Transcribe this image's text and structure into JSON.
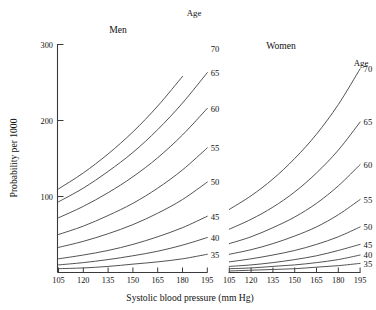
{
  "chart_data": {
    "type": "line",
    "title": "",
    "xlabel": "Systolic blood pressure (mm Hg)",
    "ylabel": "Probability per 1000",
    "x": [
      105,
      120,
      135,
      150,
      165,
      180,
      195
    ],
    "xlim": [
      105,
      195
    ],
    "ylim": [
      0,
      300
    ],
    "xticks": [
      "105",
      "120",
      "135",
      "150",
      "165",
      "180",
      "195"
    ],
    "yticks": [
      "100",
      "200",
      "300"
    ],
    "grid": false,
    "legend_position": "inline-right-of-curves",
    "legend_title": "Age",
    "panels": [
      {
        "name": "men",
        "label": "Men",
        "legend_title": "Age",
        "series": [
          {
            "name": "70",
            "label": "70",
            "values": [
              110,
              131,
              156,
              185,
              219,
              258,
              302
            ]
          },
          {
            "name": "65",
            "label": "65",
            "values": [
              93,
              111,
              133,
              158,
              188,
              223,
              263
            ]
          },
          {
            "name": "60",
            "label": "60",
            "values": [
              72,
              87,
              105,
              126,
              151,
              181,
              216
            ]
          },
          {
            "name": "55",
            "label": "55",
            "values": [
              50,
              61,
              75,
              91,
              111,
              135,
              164
            ]
          },
          {
            "name": "50",
            "label": "50",
            "values": [
              33,
              41,
              51,
              63,
              78,
              96,
              119
            ]
          },
          {
            "name": "45",
            "label": "45",
            "values": [
              18,
              23,
              29,
              37,
              47,
              59,
              74
            ]
          },
          {
            "name": "40",
            "label": "40",
            "values": [
              10,
              13,
              17,
              22,
              28,
              36,
              46
            ]
          },
          {
            "name": "35",
            "label": "35",
            "values": [
              5,
              6,
              8,
              11,
              14,
              18,
              24
            ]
          }
        ]
      },
      {
        "name": "women",
        "label": "Women",
        "legend_title": "Age",
        "series": [
          {
            "name": "70",
            "label": "70",
            "values": [
              83,
              101,
              123,
              150,
              182,
              221,
              268
            ]
          },
          {
            "name": "65",
            "label": "65",
            "values": [
              57,
              70,
              86,
              106,
              131,
              161,
              198
            ]
          },
          {
            "name": "60",
            "label": "60",
            "values": [
              38,
              47,
              59,
              73,
              91,
              114,
              142
            ]
          },
          {
            "name": "55",
            "label": "55",
            "values": [
              24,
              30,
              38,
              48,
              60,
              76,
              96
            ]
          },
          {
            "name": "50",
            "label": "50",
            "values": [
              14,
              18,
              23,
              29,
              37,
              47,
              60
            ]
          },
          {
            "name": "45",
            "label": "45",
            "values": [
              8,
              10,
              13,
              17,
              22,
              29,
              37
            ]
          },
          {
            "name": "40",
            "label": "40",
            "values": [
              5,
              6,
              8,
              10,
              13,
              17,
              23
            ]
          },
          {
            "name": "35",
            "label": "35",
            "values": [
              2,
              3,
              4,
              5,
              7,
              9,
              12
            ]
          }
        ]
      }
    ]
  },
  "axes": {
    "y_title": "Probability per 1000",
    "x_title": "Systolic blood pressure (mm Hg)"
  },
  "colors": {
    "curve": "#4a4a4a",
    "axis": "#3a3a3a",
    "text": "#111111",
    "background": "#ffffff"
  }
}
